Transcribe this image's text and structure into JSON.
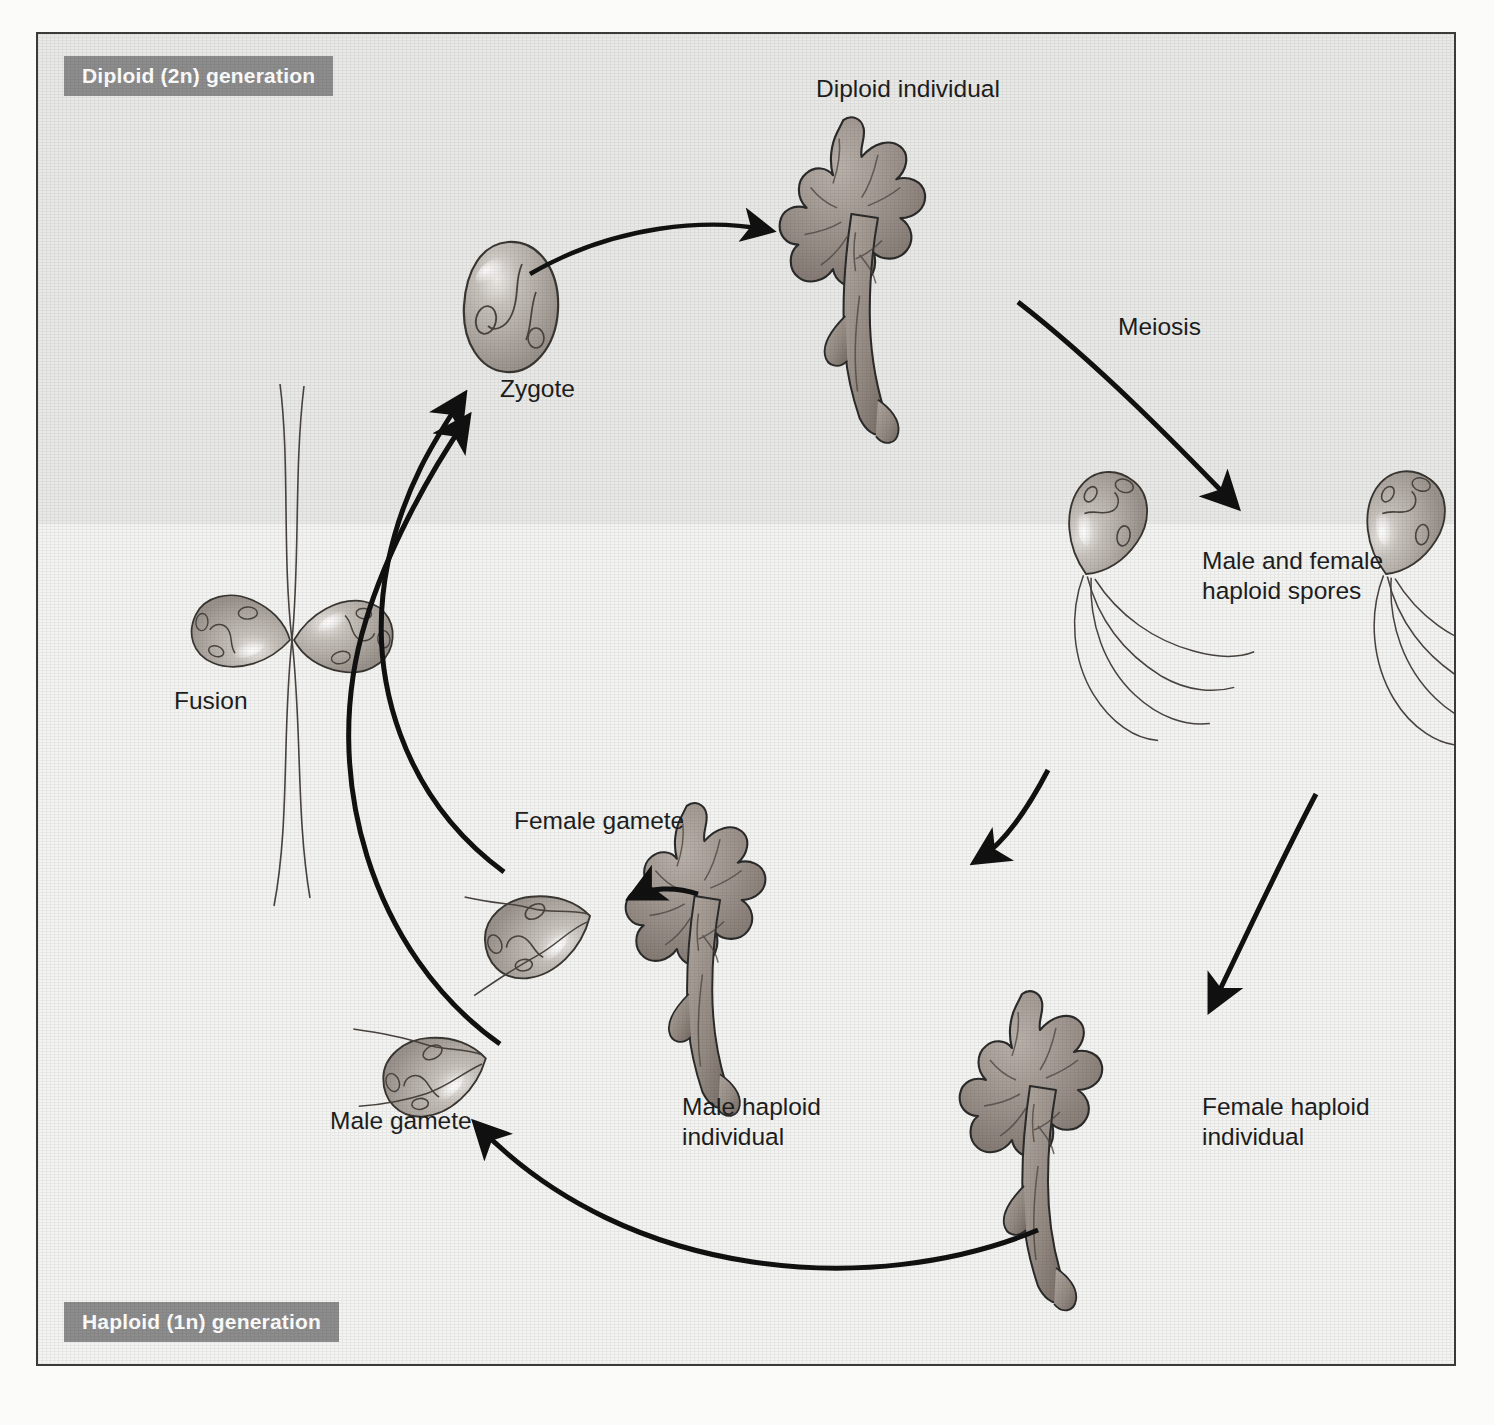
{
  "diagram": {
    "type": "life-cycle-diagram"
  },
  "zones": {
    "diploid": {
      "band_label": "Diploid (2n) generation",
      "band_color": "#8d8d8d",
      "background": "#e9e9e7"
    },
    "haploid": {
      "band_label": "Haploid (1n) generation",
      "band_color": "#8d8d8d",
      "background": "#f4f4f2"
    }
  },
  "labels": {
    "diploid_individual": "Diploid individual",
    "meiosis": "Meiosis",
    "haploid_spores": "Male and female\nhaploid spores",
    "female_haploid_individual": "Female haploid\nindividual",
    "male_haploid_individual": "Male haploid\nindividual",
    "female_gamete": "Female gamete",
    "male_gamete": "Male gamete",
    "fusion": "Fusion",
    "zygote": "Zygote"
  },
  "stages": [
    {
      "id": "zygote",
      "label": "Zygote",
      "ploidy": "2n"
    },
    {
      "id": "diploid-individual",
      "label": "Diploid individual",
      "ploidy": "2n"
    },
    {
      "id": "haploid-spores",
      "label": "Male and female haploid spores",
      "ploidy": "1n"
    },
    {
      "id": "male-haploid-individual",
      "label": "Male haploid individual",
      "ploidy": "1n"
    },
    {
      "id": "female-haploid-individual",
      "label": "Female haploid individual",
      "ploidy": "1n"
    },
    {
      "id": "male-gamete",
      "label": "Male gamete",
      "ploidy": "1n"
    },
    {
      "id": "female-gamete",
      "label": "Female gamete",
      "ploidy": "1n"
    },
    {
      "id": "fusion",
      "label": "Fusion",
      "ploidy": "1n to 2n"
    }
  ],
  "processes": [
    {
      "id": "meiosis",
      "label": "Meiosis",
      "from": "diploid-individual",
      "to": "haploid-spores"
    },
    {
      "id": "fusion",
      "label": "Fusion",
      "from": "gametes",
      "to": "zygote"
    }
  ],
  "colors": {
    "frame_border": "#3a3a3a",
    "band": "#8d8d8d",
    "band_text": "#ffffff",
    "text": "#1e1e1e",
    "arrow": "#111111",
    "algae_fill": "#9a9089",
    "algae_stroke": "#2b2b2b",
    "cell_fill": "#b5aea8"
  }
}
